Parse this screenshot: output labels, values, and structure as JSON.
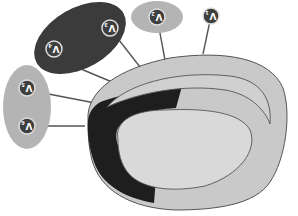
{
  "diagram": {
    "orientation": "rotated 180 degrees",
    "colors": {
      "background": "#ffffff",
      "dark_ellipse": "#3b3b3b",
      "light_ellipse": "#b4b4b4",
      "outer_body": "#c9c9c9",
      "inner_region": "#d9d9d9",
      "dark_band": "#1e1e1e",
      "line": "#555555",
      "badge_dark": "#3f3f3f"
    },
    "labels": [
      {
        "id": "V1",
        "main": "V",
        "sub": "1",
        "group": "standalone"
      },
      {
        "id": "V2",
        "main": "V",
        "sub": "2",
        "group": "light-ellipse-top"
      },
      {
        "id": "V3",
        "main": "V",
        "sub": "3",
        "group": "dark-ellipse"
      },
      {
        "id": "V4",
        "main": "V",
        "sub": "4",
        "group": "dark-ellipse"
      },
      {
        "id": "V5",
        "main": "V",
        "sub": "5",
        "group": "light-ellipse-left"
      },
      {
        "id": "V6",
        "main": "V",
        "sub": "6",
        "group": "light-ellipse-left"
      }
    ]
  }
}
